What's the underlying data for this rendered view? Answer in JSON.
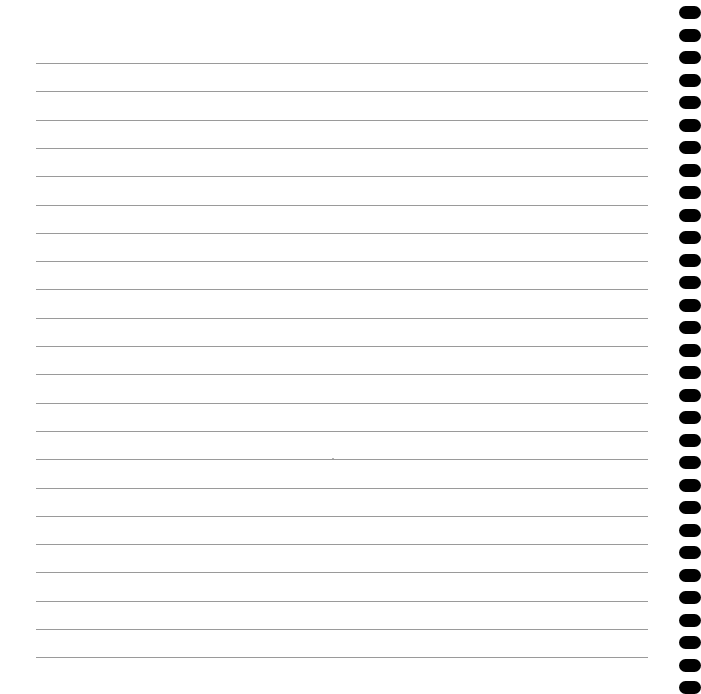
{
  "page": {
    "type": "lined-notebook-page",
    "background": "#ffffff",
    "rule_color": "#9a9a9a",
    "hole_color": "#000000",
    "rules": {
      "count": 22,
      "start_y": 63,
      "spacing": 28.3,
      "left": 36,
      "right": 648
    },
    "holes": {
      "count": 31,
      "start_y": 6,
      "spacing": 22.5,
      "left": 679
    },
    "speck": {
      "x": 332,
      "y": 458
    }
  }
}
